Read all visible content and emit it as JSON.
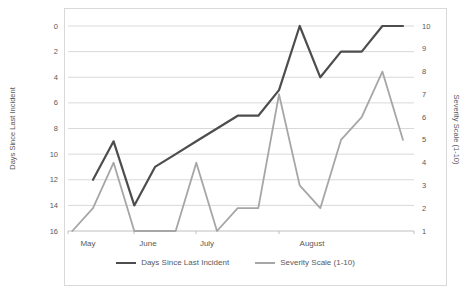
{
  "chart_data": {
    "type": "line",
    "title": "",
    "left_axis": {
      "title": "Days Since Last Incident",
      "min": 0,
      "max": 16,
      "inverted": true,
      "ticks": [
        0,
        2,
        4,
        6,
        8,
        10,
        12,
        14,
        16
      ]
    },
    "right_axis": {
      "title": "Severity Scale (1-10)",
      "min": 1,
      "max": 10,
      "ticks": [
        10,
        9,
        8,
        7,
        6,
        5,
        4,
        3,
        2,
        1
      ]
    },
    "x_axis": {
      "months": [
        {
          "label": "May",
          "x_px": 88
        },
        {
          "label": "June",
          "x_px": 148
        },
        {
          "label": "July",
          "x_px": 207
        },
        {
          "label": "August",
          "x_px": 312
        }
      ],
      "tick_x_px": [
        68,
        134,
        196,
        279,
        414
      ]
    },
    "series": [
      {
        "name": "Days Since Last Incident",
        "axis": "left",
        "color": "#4d4d4d",
        "line_width": 2.2,
        "start_index": 1,
        "values": [
          12,
          9,
          14,
          11,
          10,
          9,
          8,
          7,
          7,
          5,
          0,
          4,
          2,
          2,
          0,
          0
        ]
      },
      {
        "name": "Severity Scale (1-10)",
        "axis": "right",
        "color": "#a6a6a6",
        "line_width": 1.8,
        "start_index": 0,
        "values": [
          1,
          2,
          4,
          1,
          1,
          1,
          4,
          1,
          2,
          2,
          7,
          3,
          2,
          5,
          6,
          8,
          5
        ]
      }
    ],
    "legend_position": "bottom",
    "grid": true,
    "gridline_color": "#d9d9d9",
    "axisline_color": "#bfbfbf"
  }
}
